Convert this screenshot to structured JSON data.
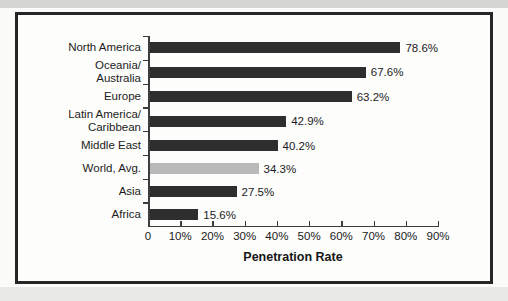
{
  "chart_data": {
    "type": "bar",
    "orientation": "horizontal",
    "categories": [
      "North America",
      "Oceania/Australia",
      "Europe",
      "Latin America/Caribbean",
      "Middle East",
      "World, Avg.",
      "Asia",
      "Africa"
    ],
    "label_lines": [
      [
        "North America"
      ],
      [
        "Oceania/",
        "Australia"
      ],
      [
        "Europe"
      ],
      [
        "Latin America/",
        "Caribbean"
      ],
      [
        "Middle East"
      ],
      [
        "World, Avg."
      ],
      [
        "Asia"
      ],
      [
        "Africa"
      ]
    ],
    "values": [
      78.6,
      67.6,
      63.2,
      42.9,
      40.2,
      34.3,
      27.5,
      15.6
    ],
    "value_labels": [
      "78.6%",
      "67.6%",
      "63.2%",
      "42.9%",
      "40.2%",
      "34.3%",
      "27.5%",
      "15.6%"
    ],
    "highlight_index": 5,
    "xlabel": "Penetration Rate",
    "xlim": [
      0,
      90
    ],
    "xticks": [
      "0",
      "10%",
      "20%",
      "30%",
      "40%",
      "50%",
      "60%",
      "70%",
      "80%",
      "90%"
    ],
    "grid": "off",
    "legend": "none"
  },
  "colors": {
    "bar": "#2e2e2e",
    "highlight_bar": "#b9b9b9",
    "axis": "#3d3d3d",
    "frame_border": "#262626",
    "chart_background": "#fdfdfb",
    "text": "#1b1b1b"
  }
}
